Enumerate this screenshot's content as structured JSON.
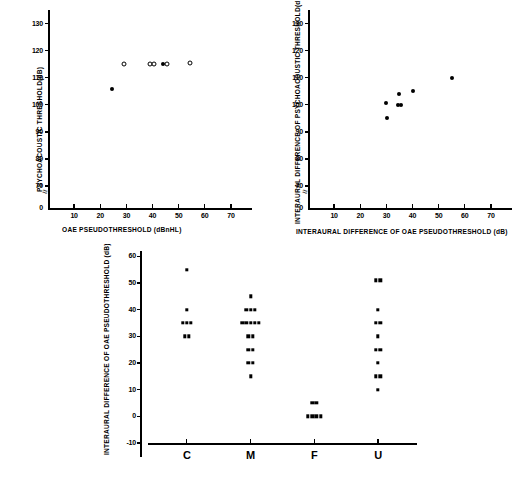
{
  "figure": {
    "panels": [
      "psychoacoustic-vs-oae",
      "interaural-difference",
      "oae-difference-by-category"
    ]
  },
  "chart_data": [
    {
      "id": "panel-a",
      "type": "scatter",
      "title": "",
      "xlabel": "OAE PSEUDOTHRESHOLD (dBnHL)",
      "ylabel": "PSYCHOACOUSTIC THRESHOLD(dB)",
      "xlim": [
        0,
        75
      ],
      "ylim": [
        0,
        135
      ],
      "xticks": [
        10,
        20,
        30,
        40,
        50,
        60,
        70
      ],
      "yticks": [
        0,
        70,
        80,
        90,
        100,
        110,
        120,
        130
      ],
      "y_axis_break": true,
      "grid": false,
      "legend": "none",
      "series": [
        {
          "name": "open-circle",
          "marker": "open",
          "points": [
            {
              "x": 29.0,
              "y": 115
            },
            {
              "x": 39.0,
              "y": 115
            },
            {
              "x": 40.5,
              "y": 115
            },
            {
              "x": 45.5,
              "y": 115
            },
            {
              "x": 54.5,
              "y": 115.5
            }
          ]
        },
        {
          "name": "filled-circle",
          "marker": "filled",
          "points": [
            {
              "x": 44.0,
              "y": 115
            },
            {
              "x": 24.5,
              "y": 106
            }
          ]
        }
      ]
    },
    {
      "id": "panel-b",
      "type": "scatter",
      "title": "",
      "xlabel": "INTERAURAL DIFFERENCE OF OAE PSEUDOTHRESHOLD (dB)",
      "ylabel": "INTERAURAL DIFFERENCE OF PSYCHOACOUSTIC THRESHOLD(dB)",
      "xlim": [
        0,
        75
      ],
      "ylim": [
        0,
        135
      ],
      "xticks": [
        10,
        20,
        30,
        40,
        50,
        60,
        70
      ],
      "yticks": [
        0,
        70,
        80,
        90,
        100,
        110,
        120,
        130
      ],
      "y_axis_break": true,
      "grid": false,
      "legend": "none",
      "series": [
        {
          "name": "filled-circle",
          "marker": "filled",
          "points": [
            {
              "x": 30.0,
              "y": 100.5
            },
            {
              "x": 30.2,
              "y": 95.0
            },
            {
              "x": 34.6,
              "y": 100.0
            },
            {
              "x": 35.4,
              "y": 100.0
            },
            {
              "x": 35.0,
              "y": 104.0
            },
            {
              "x": 40.0,
              "y": 105.0
            },
            {
              "x": 55.0,
              "y": 110.0
            }
          ]
        }
      ]
    },
    {
      "id": "panel-c",
      "type": "scatter",
      "title": "",
      "xlabel": "",
      "ylabel": "INTERAURAL DIFFERENCE OF OAE PSEUDOTHRESHOLD (dB)",
      "categories": [
        "C",
        "M",
        "F",
        "U"
      ],
      "ylim": [
        -10,
        62
      ],
      "yticks": [
        -10,
        0,
        10,
        20,
        30,
        40,
        50,
        60
      ],
      "grid": false,
      "legend": "none",
      "groups": [
        {
          "category": "C",
          "values": [
            55,
            40,
            35,
            35,
            35,
            30,
            30
          ]
        },
        {
          "category": "M",
          "values": [
            45,
            40,
            40,
            40,
            35,
            35,
            35,
            35,
            35,
            30,
            30,
            25,
            25,
            20,
            20,
            15
          ]
        },
        {
          "category": "F",
          "values": [
            5,
            5,
            0,
            0,
            0,
            0
          ]
        },
        {
          "category": "U",
          "values": [
            51,
            51,
            40,
            35,
            35,
            30,
            25,
            25,
            20,
            15,
            15,
            10
          ]
        }
      ]
    }
  ],
  "panel_a": {
    "ylabel": "PSYCHOACOUSTIC THRESHOLD(dB)",
    "xlabel": "OAE PSEUDOTHRESHOLD (dBnHL)",
    "yticks": [
      "130",
      "120",
      "110",
      "100",
      "90",
      "80",
      "70",
      "0"
    ],
    "xticks": [
      "10",
      "20",
      "30",
      "40",
      "50",
      "60",
      "70"
    ]
  },
  "panel_b": {
    "ylabel": "INTERAURAL DIFFERENCE OF PSYCHOACOUSTIC THRESHOLD(dB)",
    "xlabel": "INTERAURAL DIFFERENCE OF OAE PSEUDOTHRESHOLD (dB)",
    "yticks": [
      "130",
      "120",
      "110",
      "100",
      "90",
      "80",
      "70",
      "0"
    ],
    "xticks": [
      "10",
      "20",
      "30",
      "40",
      "50",
      "60",
      "70"
    ]
  },
  "panel_c": {
    "ylabel": "INTERAURAL DIFFERENCE OF OAE PSEUDOTHRESHOLD (dB)",
    "yticks": [
      "60",
      "50",
      "40",
      "30",
      "20",
      "10",
      "0",
      "-10"
    ],
    "xticks": [
      "C",
      "M",
      "F",
      "U"
    ]
  }
}
